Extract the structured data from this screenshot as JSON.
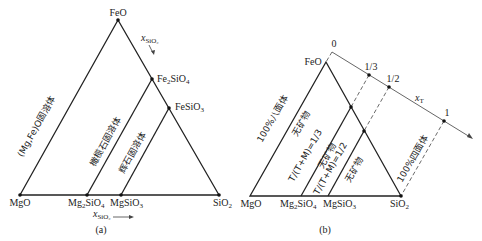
{
  "panel_a": {
    "caption": "(a)",
    "vertices": {
      "top": "FeO",
      "bottom_left": "MgO",
      "bottom_right": "SiO",
      "bottom_right_sub": "2"
    },
    "edge_points": {
      "fe2sio4": {
        "main": "Fe",
        "sub1": "2",
        "mid": "SiO",
        "sub2": "4"
      },
      "fesio3": {
        "main": "FeSiO",
        "sub": "3"
      },
      "mg2sio4": {
        "main": "Mg",
        "sub1": "2",
        "mid": "SiO",
        "sub2": "4"
      },
      "mgsio3": {
        "main": "MgSiO",
        "sub": "3"
      }
    },
    "region_labels": {
      "mgfeo": "(Mg,Fe)O固溶体",
      "olivine": "橄榄石固溶体",
      "pyroxene": "辉石固溶体"
    },
    "axis_label_top": {
      "var": "x",
      "sub": "SiO₂"
    },
    "axis_label_bottom": {
      "var": "x",
      "sub": "SiO₂"
    }
  },
  "panel_b": {
    "caption": "(b)",
    "vertices": {
      "top": "FeO",
      "bottom_left": "MgO",
      "bottom_right": "SiO",
      "bottom_right_sub": "2"
    },
    "edge_points": {
      "mg2sio4": {
        "main": "Mg",
        "sub1": "2",
        "mid": "SiO",
        "sub2": "4"
      },
      "mgsio3": {
        "main": "MgSiO",
        "sub": "3"
      }
    },
    "region_labels": {
      "octahedra": "100%八面体",
      "no_mineral_1": "无矿物",
      "ratio_1_3": "T/(T+M)=1/3",
      "no_mineral_2": "无矿物",
      "ratio_1_2": "T/(T+M)=1/2",
      "no_mineral_3": "无矿物",
      "tetrahedra": "100%四面体"
    },
    "xt_axis": {
      "label_var": "x",
      "label_sub": "T",
      "ticks": [
        "0",
        "1/3",
        "1/2",
        "1"
      ]
    }
  }
}
